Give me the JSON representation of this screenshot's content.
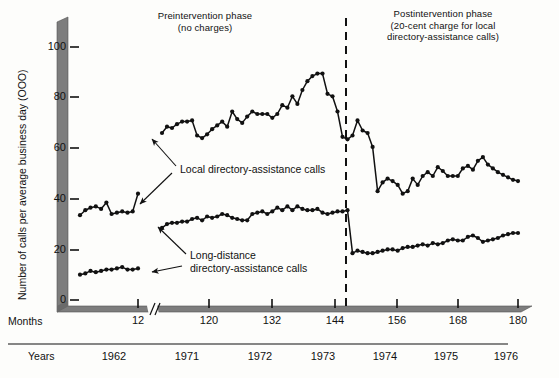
{
  "figure": {
    "phase_left_title": "Preintervention phase\n(no charges)",
    "phase_right_title": "Postintervention phase\n(20-cent charge for local\ndirectory-assistance calls)",
    "annotation_local": "Local directory-assistance calls",
    "annotation_long": "Long-distance\ndirectory-assistance calls",
    "row_label_months": "Months",
    "row_label_years": "Years",
    "axis_break_symbol": "//",
    "ink_color": "#111111",
    "axis_band_color": "#7d7d7d"
  },
  "chart_data": {
    "type": "line",
    "title": "Number of calls per average business day (OOO)",
    "subtitle": "Preintervention phase (no charges) / Postintervention phase (20-cent charge for local directory-assistance calls)",
    "xlabel": "Months",
    "ylabel": "Number of calls per average business day (OOO)",
    "ylim": [
      0,
      108
    ],
    "yticks": [
      0,
      20,
      40,
      60,
      80,
      100
    ],
    "xticks": [
      12,
      120,
      132,
      144,
      156,
      168,
      180
    ],
    "xtick_labels": [
      "12",
      "120",
      "132",
      "144",
      "156",
      "168",
      "180"
    ],
    "year_labels": [
      "1962",
      "1971",
      "1972",
      "1973",
      "1974",
      "1975",
      "1976"
    ],
    "year_positions": [
      6,
      114,
      126,
      138,
      150,
      162,
      174
    ],
    "grid": false,
    "legend": "annotations on plot",
    "axis_break_after_x": 12,
    "intervention_line_x": 146,
    "intervention_label": "20-cent charge introduced",
    "series": [
      {
        "name": "Local directory-assistance calls",
        "x": [
          1,
          2,
          3,
          4,
          5,
          6,
          7,
          8,
          9,
          10,
          11,
          12,
          109,
          110,
          111,
          112,
          113,
          114,
          115,
          116,
          117,
          118,
          119,
          120,
          121,
          122,
          123,
          124,
          125,
          126,
          127,
          128,
          129,
          130,
          131,
          132,
          133,
          134,
          135,
          136,
          137,
          138,
          139,
          140,
          141,
          142,
          143,
          144,
          145,
          146,
          147,
          148,
          149,
          150,
          151,
          152,
          153,
          154,
          155,
          156,
          157,
          158,
          159,
          160,
          161,
          162,
          163,
          164,
          165,
          166,
          167,
          168,
          169,
          170,
          171,
          172,
          173,
          174,
          175,
          176,
          177,
          178,
          179,
          180
        ],
        "values": [
          33.5,
          35.5,
          36.5,
          37.0,
          36.0,
          38.5,
          34.0,
          34.5,
          35.0,
          34.5,
          35.0,
          42.0,
          66.0,
          68.5,
          68.0,
          69.5,
          70.5,
          70.5,
          71.0,
          65.0,
          64.0,
          65.5,
          67.5,
          69.0,
          70.5,
          68.5,
          74.5,
          71.5,
          70.0,
          72.5,
          74.5,
          73.5,
          73.5,
          73.5,
          72.0,
          73.5,
          77.0,
          76.0,
          80.5,
          77.5,
          83.0,
          86.5,
          88.5,
          89.5,
          89.5,
          81.5,
          80.5,
          74.5,
          64.5,
          63.5,
          65.0,
          71.0,
          67.0,
          66.0,
          60.5,
          43.0,
          46.5,
          48.0,
          47.0,
          45.5,
          42.0,
          43.0,
          48.0,
          45.5,
          49.0,
          50.5,
          49.0,
          52.5,
          51.0,
          49.0,
          49.0,
          49.0,
          52.0,
          53.0,
          51.5,
          55.0,
          56.5,
          53.5,
          52.0,
          50.5,
          49.5,
          48.5,
          47.5,
          47.0
        ]
      },
      {
        "name": "Long-distance directory-assistance calls",
        "x": [
          1,
          2,
          3,
          4,
          5,
          6,
          7,
          8,
          9,
          10,
          11,
          12,
          109,
          110,
          111,
          112,
          113,
          114,
          115,
          116,
          117,
          118,
          119,
          120,
          121,
          122,
          123,
          124,
          125,
          126,
          127,
          128,
          129,
          130,
          131,
          132,
          133,
          134,
          135,
          136,
          137,
          138,
          139,
          140,
          141,
          142,
          143,
          144,
          145,
          146,
          147,
          148,
          149,
          150,
          151,
          152,
          153,
          154,
          155,
          156,
          157,
          158,
          159,
          160,
          161,
          162,
          163,
          164,
          165,
          166,
          167,
          168,
          169,
          170,
          171,
          172,
          173,
          174,
          175,
          176,
          177,
          178,
          179,
          180
        ],
        "values": [
          10.0,
          10.5,
          11.5,
          11.0,
          11.5,
          12.0,
          12.0,
          12.5,
          13.0,
          12.0,
          12.0,
          12.5,
          28.5,
          30.0,
          30.5,
          30.5,
          31.0,
          31.0,
          32.0,
          32.5,
          31.5,
          33.0,
          32.5,
          33.0,
          34.0,
          33.5,
          32.5,
          32.0,
          31.5,
          31.5,
          34.0,
          34.5,
          35.0,
          34.0,
          35.0,
          36.5,
          35.5,
          37.0,
          35.5,
          37.0,
          36.0,
          35.5,
          35.5,
          36.0,
          34.5,
          34.0,
          34.5,
          35.0,
          35.0,
          35.5,
          18.5,
          19.5,
          19.0,
          18.5,
          18.5,
          19.0,
          19.5,
          20.0,
          20.0,
          19.5,
          20.5,
          21.0,
          21.0,
          21.5,
          22.0,
          21.5,
          22.5,
          22.0,
          22.5,
          23.5,
          24.0,
          23.5,
          23.5,
          25.0,
          25.5,
          24.5,
          23.0,
          23.5,
          24.0,
          24.5,
          25.5,
          26.0,
          26.5,
          26.5
        ]
      }
    ]
  }
}
